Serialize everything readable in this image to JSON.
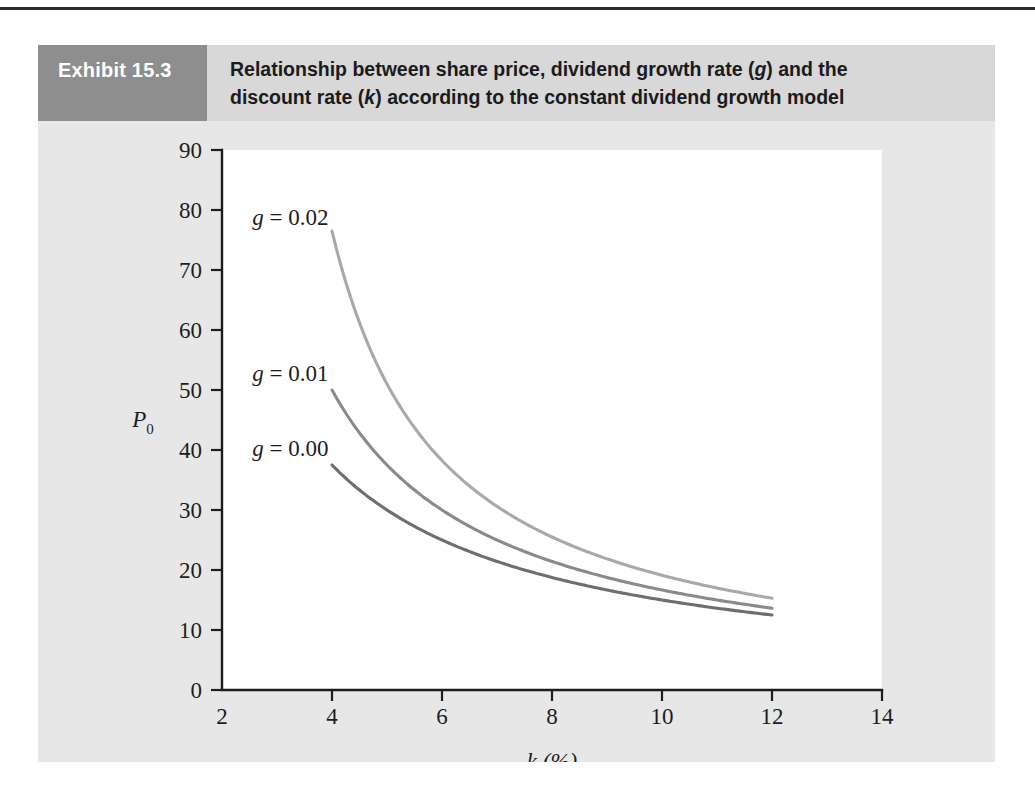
{
  "page": {
    "background": "#ffffff",
    "panel_color": "#e6e7e6",
    "header_color": "#d7d8d7",
    "number_box_color": "#8d8e8d"
  },
  "exhibit": {
    "number_label": "Exhibit 15.3",
    "title_line1_a": "Relationship between share price, dividend growth rate (",
    "title_line1_g": "g",
    "title_line1_b": ") and the",
    "title_line2_a": "discount rate (",
    "title_line2_k": "k",
    "title_line2_b": ") according to the constant dividend growth model"
  },
  "chart_data": {
    "type": "line",
    "title": "Relationship between share price, dividend growth rate (g) and the discount rate (k) according to the constant dividend growth model",
    "xlabel": "k (%)",
    "ylabel": "P0",
    "ylabel_main": "P",
    "ylabel_sub": "0",
    "xlim": [
      2,
      14
    ],
    "ylim": [
      0,
      90
    ],
    "xticks": [
      2,
      4,
      6,
      8,
      10,
      12,
      14
    ],
    "xtick_labels": [
      "2",
      "4",
      "6",
      "8",
      "10",
      "12",
      "14"
    ],
    "yticks": [
      0,
      10,
      20,
      30,
      40,
      50,
      60,
      70,
      80,
      90
    ],
    "ytick_labels": [
      "0",
      "10",
      "20",
      "30",
      "40",
      "50",
      "60",
      "70",
      "80",
      "90"
    ],
    "grid": false,
    "legend": "inline-labels",
    "x": [
      4,
      5,
      6,
      7,
      8,
      9,
      10,
      11,
      12
    ],
    "series": [
      {
        "name": "g = 0.02",
        "label_it": "g",
        "label_rest": " = 0.02",
        "color": "#a9a9a9",
        "label_x": 2.55,
        "label_y": 77.5,
        "growth": 0.02,
        "values": [
          76.5,
          51.0,
          38.3,
          30.6,
          25.5,
          21.9,
          19.1,
          17.0,
          15.3
        ]
      },
      {
        "name": "g = 0.01",
        "label_it": "g",
        "label_rest": " = 0.01",
        "color": "#8a8a8a",
        "label_x": 2.55,
        "label_y": 51.5,
        "growth": 0.01,
        "values": [
          50.0,
          37.5,
          30.0,
          25.0,
          21.4,
          18.8,
          16.7,
          15.0,
          13.6
        ]
      },
      {
        "name": "g = 0.00",
        "label_it": "g",
        "label_rest": " = 0.00",
        "color": "#6e6e6e",
        "label_x": 2.55,
        "label_y": 39.0,
        "growth": 0.0,
        "values": [
          37.5,
          30.0,
          25.0,
          21.4,
          18.8,
          16.7,
          15.0,
          13.6,
          12.5
        ]
      }
    ]
  }
}
